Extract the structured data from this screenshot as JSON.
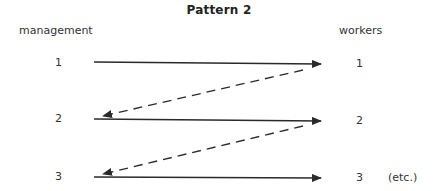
{
  "diagram": {
    "title": "Pattern 2",
    "left_column_label": "management",
    "right_column_label": "workers",
    "levels": [
      {
        "left": "1",
        "right": "1"
      },
      {
        "left": "2",
        "right": "2"
      },
      {
        "left": "3",
        "right": "3"
      }
    ],
    "continuation_note": "(etc.)",
    "edges": [
      {
        "from": "management 1",
        "to": "workers 1",
        "style": "solid"
      },
      {
        "from": "workers 1",
        "to": "management 2",
        "style": "dashed"
      },
      {
        "from": "management 2",
        "to": "workers 2",
        "style": "solid"
      },
      {
        "from": "workers 2",
        "to": "management 3",
        "style": "dashed"
      },
      {
        "from": "management 3",
        "to": "workers 3",
        "style": "solid"
      }
    ],
    "line_color": "#2a2a2a"
  }
}
